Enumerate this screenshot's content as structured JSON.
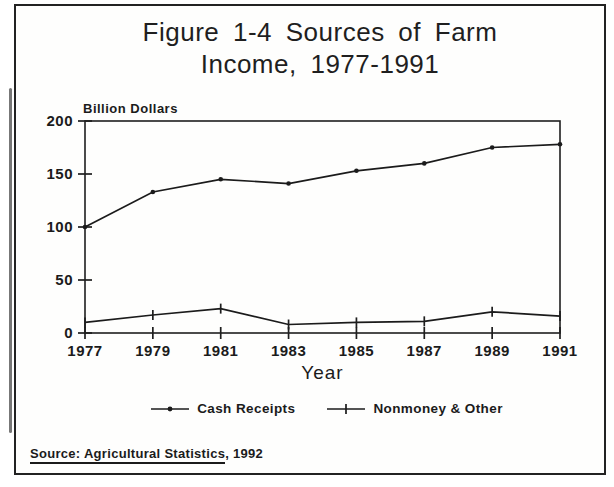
{
  "figure": {
    "title_line1": "Figure 1-4  Sources of Farm",
    "title_line2": "Income, 1977-1991"
  },
  "source": {
    "underlined": "Source: Agricultural Statistics",
    "rest": ", 1992"
  },
  "colors": {
    "ink": "#1b1b1b",
    "paper": "#fefefd"
  },
  "chart_data": {
    "type": "line",
    "title": "Figure 1-4 Sources of Farm Income, 1977-1991",
    "xlabel": "Year",
    "ylabel": "Billion Dollars",
    "x": [
      1977,
      1979,
      1981,
      1983,
      1985,
      1987,
      1989,
      1991
    ],
    "xtick_labels": [
      "1977",
      "1979",
      "1981",
      "1983",
      "1985",
      "1987",
      "1989",
      "1991"
    ],
    "yticks": [
      0,
      50,
      100,
      150,
      200
    ],
    "ylim": [
      0,
      200
    ],
    "grid": false,
    "legend_position": "bottom",
    "series": [
      {
        "name": "Cash Receipts",
        "marker": "dot",
        "values": [
          100,
          133,
          145,
          141,
          153,
          160,
          175,
          178
        ]
      },
      {
        "name": "Nonmoney & Other",
        "marker": "plus",
        "values": [
          10,
          17,
          23,
          8,
          10,
          11,
          20,
          16
        ]
      }
    ]
  }
}
